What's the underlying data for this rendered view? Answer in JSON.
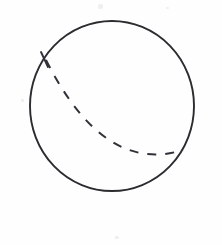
{
  "figure": {
    "kind": "sphere-with-hidden-great-circle",
    "title": "",
    "caption": "",
    "background_color": "#fefefe",
    "stroke_color": "#2b2b30",
    "dash_color": "#31313a",
    "canvas": {
      "width": 222,
      "height": 245
    },
    "sphere": {
      "label": "sphere-outline",
      "center_x": 112,
      "center_y": 106,
      "radius_x": 82,
      "radius_y": 85,
      "stroke_width": 1.9
    },
    "hidden_arc": {
      "label": "hidden-great-circle-arc",
      "style": "dashed",
      "dash_on": 9,
      "dash_off": 9,
      "stroke_width": 2.0,
      "start_x": 46,
      "start_y": 60,
      "control_x": 104,
      "control_y": 175,
      "end_x": 183,
      "end_y": 150
    },
    "arc_tick": {
      "label": "arc-start-tick",
      "x1": 41,
      "y1": 52,
      "x2": 48,
      "y2": 67
    },
    "specks": [
      {
        "left": 98,
        "top": 4,
        "width": 5,
        "height": 5
      },
      {
        "left": 21,
        "top": 99,
        "width": 3,
        "height": 3
      },
      {
        "left": 115,
        "top": 236,
        "width": 4,
        "height": 3
      },
      {
        "left": 166,
        "top": 7,
        "width": 3,
        "height": 2
      }
    ]
  }
}
